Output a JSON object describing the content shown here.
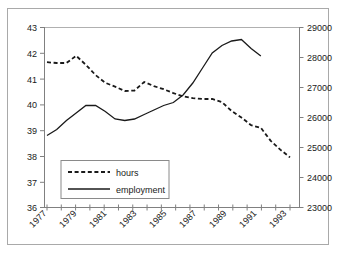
{
  "chart_data": {
    "type": "line",
    "title": "",
    "xlabel": "",
    "ylabel": "",
    "x": [
      1977,
      1978,
      1979,
      1980,
      1981,
      1982,
      1983,
      1984,
      1985,
      1986,
      1987,
      1988,
      1989,
      1990,
      1991,
      1992,
      1993,
      1994
    ],
    "xtick_labels": [
      "1977",
      "1979",
      "1981",
      "1983",
      "1985",
      "1987",
      "1989",
      "1991",
      "1993"
    ],
    "xlim": [
      1977,
      1994
    ],
    "grid": false,
    "legend_position": "lower-left-inside",
    "axes": [
      {
        "id": "left",
        "name": "hours",
        "ylim": [
          36,
          43
        ],
        "ytick_labels": [
          "36",
          "37",
          "38",
          "39",
          "40",
          "41",
          "42",
          "43"
        ],
        "yticks": [
          36,
          37,
          38,
          39,
          40,
          41,
          42,
          43
        ]
      },
      {
        "id": "right",
        "name": "employment",
        "ylim": [
          23000,
          29000
        ],
        "ytick_labels": [
          "23000",
          "24000",
          "25000",
          "26000",
          "27000",
          "28000",
          "29000"
        ],
        "yticks": [
          23000,
          24000,
          25000,
          26000,
          27000,
          28000,
          29000
        ]
      }
    ],
    "series": [
      {
        "name": "hours",
        "axis": "left",
        "style": "dashed",
        "color": "#1a1a1a",
        "values": [
          41.65,
          41.62,
          41.62,
          41.9,
          41.55,
          41.15,
          40.85,
          40.7,
          40.53,
          40.55,
          40.88,
          40.72,
          40.6,
          40.45,
          40.32,
          40.25,
          40.22,
          40.22
        ]
      },
      {
        "name": "employment",
        "axis": "right",
        "style": "solid",
        "color": "#1a1a1a",
        "values": [
          25400,
          25600,
          25900,
          26150,
          26400,
          26400,
          26200,
          25950,
          25900,
          25950,
          26100,
          26250,
          26400,
          26500,
          26750,
          27150,
          27650,
          28150
        ]
      }
    ],
    "series_extended": {
      "hours_full": [
        41.65,
        41.62,
        41.62,
        41.9,
        41.55,
        41.15,
        40.85,
        40.7,
        40.53,
        40.55,
        40.88,
        40.72,
        40.6,
        40.45,
        40.32,
        40.25,
        40.22,
        40.22,
        40.1,
        39.75,
        39.5,
        39.2,
        39.1,
        38.6,
        38.25,
        37.95
      ],
      "employment_full": [
        25400,
        25600,
        25900,
        26150,
        26400,
        26400,
        26200,
        25950,
        25900,
        25950,
        26100,
        26250,
        26400,
        26500,
        26750,
        27150,
        27650,
        28150,
        28400,
        28550,
        28600,
        28300,
        28050
      ]
    }
  },
  "legend": {
    "entries": [
      {
        "label": "hours",
        "style": "dashed"
      },
      {
        "label": "employment",
        "style": "solid"
      }
    ]
  },
  "axis_left": {
    "labels": [
      "43",
      "42",
      "41",
      "40",
      "39",
      "38",
      "37",
      "36"
    ]
  },
  "axis_right": {
    "labels": [
      "29000",
      "28000",
      "27000",
      "26000",
      "25000",
      "24000",
      "23000"
    ]
  },
  "axis_bottom": {
    "labels": [
      "1977",
      "1979",
      "1981",
      "1983",
      "1985",
      "1987",
      "1989",
      "1991",
      "1993"
    ]
  }
}
